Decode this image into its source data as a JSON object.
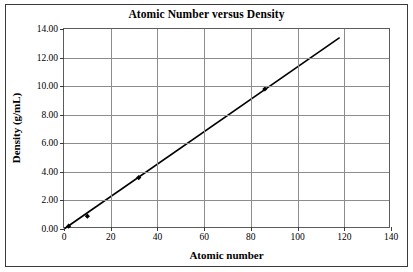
{
  "chart_data": {
    "type": "line",
    "title": "Atomic Number versus Density",
    "xlabel": "Atomic number",
    "ylabel": "Density (g/mL)",
    "xlim": [
      0,
      140
    ],
    "ylim": [
      0,
      14
    ],
    "xticks": [
      0,
      20,
      40,
      60,
      80,
      100,
      120,
      140
    ],
    "xtick_labels": [
      "0",
      "20",
      "40",
      "60",
      "80",
      "100",
      "120",
      "140"
    ],
    "yticks": [
      0,
      2,
      4,
      6,
      8,
      10,
      12,
      14
    ],
    "ytick_labels": [
      "0.00",
      "2.00",
      "4.00",
      "6.00",
      "8.00",
      "10.00",
      "12.00",
      "14.00"
    ],
    "grid": true,
    "legend": false,
    "series": [
      {
        "name": "Density",
        "marker": "diamond",
        "color": "#000000",
        "points": [
          {
            "x": 2,
            "y": 0.2
          },
          {
            "x": 10,
            "y": 0.9
          },
          {
            "x": 32,
            "y": 3.6
          },
          {
            "x": 86,
            "y": 9.8
          }
        ],
        "trendline": {
          "from": {
            "x": 0,
            "y": 0.0
          },
          "to": {
            "x": 118,
            "y": 13.4
          }
        }
      }
    ]
  },
  "figure": {
    "background_color": "#ffffff",
    "border_color": "#3a3a3a",
    "grid_color": "#8c8c8c",
    "axis_color": "#5c5c5c",
    "series_color": "#000000"
  }
}
